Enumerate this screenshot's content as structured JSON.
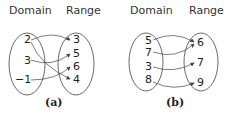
{
  "diagrams": [
    {
      "id": "a",
      "caption": "(a)",
      "domain_label": "Domain",
      "range_label": "Range",
      "domain": [
        "2",
        "3",
        "−1"
      ],
      "range": [
        "3",
        "5",
        "6",
        "4"
      ],
      "mappings": [
        [
          "2",
          "3"
        ],
        [
          "2",
          "4"
        ],
        [
          "3",
          "5"
        ],
        [
          "−1",
          "6"
        ]
      ]
    },
    {
      "id": "b",
      "caption": "(b)",
      "domain_label": "Domain",
      "range_label": "Range",
      "domain": [
        "5",
        "7",
        "3",
        "8"
      ],
      "range": [
        "6",
        "7",
        "9"
      ],
      "mappings": [
        [
          "5",
          "6"
        ],
        [
          "7",
          "6"
        ],
        [
          "3",
          "7"
        ],
        [
          "8",
          "9"
        ]
      ]
    }
  ],
  "colors": {
    "stroke": "#444444",
    "text": "#222222"
  }
}
